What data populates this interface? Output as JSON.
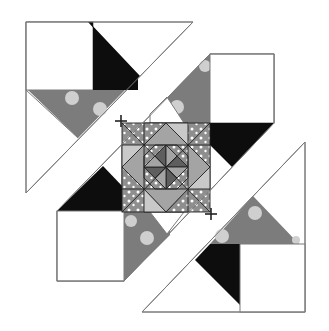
{
  "diagram": {
    "colors": {
      "background": "#ffffff",
      "outline": "#7a7a7a",
      "seam": "#222222",
      "black_fabric": "#0d0d0d",
      "grey_print": "#7c7c7c",
      "dot_print": "#8e8e8e",
      "light_patch": "#c9c9c9",
      "mid_patch": "#a4a4a4",
      "dark_patch": "#5e5e5e",
      "circle_motif": "#cfcfcf",
      "dot": "#ffffff"
    },
    "sections": [
      {
        "name": "top-left-corner-unit",
        "pieces": [
          "white square",
          "black triangle",
          "grey circle-print triangle",
          "white setting triangles"
        ]
      },
      {
        "name": "center-strip",
        "pieces": [
          "white square top-right",
          "black triangle",
          "grey circle-print triangles",
          "dotted star block",
          "white square bottom-left"
        ]
      },
      {
        "name": "bottom-right-corner-unit",
        "pieces": [
          "grey circle-print triangle",
          "black triangle",
          "white square",
          "white setting triangles"
        ]
      }
    ],
    "join_marks": [
      {
        "symbol": "+",
        "label": "join top-left unit to center strip"
      },
      {
        "symbol": "+",
        "label": "join center strip to bottom-right unit"
      }
    ]
  }
}
